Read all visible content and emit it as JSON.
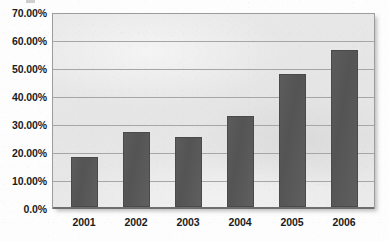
{
  "chart_data": {
    "type": "bar",
    "title": "",
    "subtitle": "",
    "xlabel": "",
    "ylabel": "",
    "categories": [
      "2001",
      "2002",
      "2003",
      "2004",
      "2005",
      "2006"
    ],
    "values": [
      18.4,
      27.8,
      26.0,
      33.6,
      49.1,
      58.1
    ],
    "series": [
      {
        "name": "",
        "values": [
          18.4,
          27.8,
          26.0,
          33.6,
          49.1,
          58.1
        ]
      }
    ],
    "ylim": [
      0,
      70
    ],
    "ytick_values": [
      0,
      10,
      20,
      30,
      40,
      50,
      60,
      70
    ],
    "ytick_labels": [
      "0.0%",
      "10.00%",
      "20.00%",
      "30.00%",
      "40.00%",
      "50.00%",
      "60.00%",
      "70.00%"
    ],
    "xtick_labels": [
      "2001",
      "2002",
      "2003",
      "2004",
      "2005",
      "2006"
    ],
    "grid": true,
    "grid_axis": "y",
    "legend": false,
    "legend_position": "none",
    "annotations": [],
    "colors": {
      "bar_fill": "#575757",
      "bar_border": "#4a4a4a",
      "plot_background": "#e7e7e7",
      "plot_border": "#9d9d9d",
      "gridline": "#a6a6a6",
      "baseline": "#6e6e6e",
      "text": "#1b1b1b",
      "figure_background": "#fdfdfd"
    }
  }
}
